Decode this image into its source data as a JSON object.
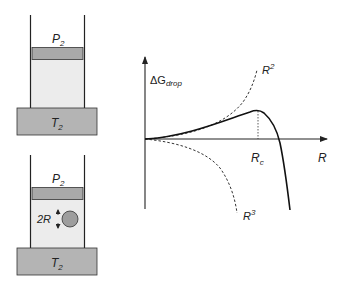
{
  "top_cylinder": {
    "piston_label": "P",
    "piston_sub": "2",
    "base_label": "T",
    "base_sub": "2"
  },
  "bottom_cylinder": {
    "piston_label": "P",
    "piston_sub": "2",
    "base_label": "T",
    "base_sub": "2",
    "drop_label": "2R"
  },
  "graph": {
    "y_label": "ΔG",
    "y_label_sub": "drop",
    "x_label": "R",
    "critical_label": "R",
    "critical_sub": "c",
    "surface_term": "R",
    "surface_power": "2",
    "volume_term": "R",
    "volume_power": "3"
  },
  "colors": {
    "piston": "#a9a9a9",
    "gas": "#ececec",
    "base": "#b4b4b4",
    "drop": "#9e9e9e",
    "line": "#222222"
  }
}
